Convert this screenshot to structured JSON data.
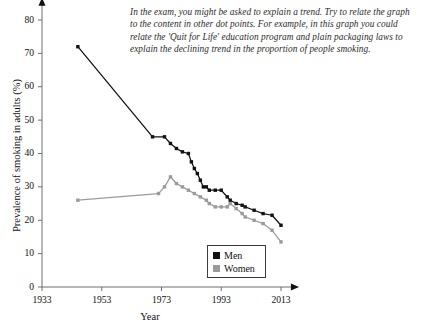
{
  "annotation": {
    "text": "In the exam, you might be asked to explain a trend. Try to relate the graph to the content in other dot points. For example, in this graph you could relate the 'Quit for Life' education program and plain packaging laws to explain the declining trend in the proportion of people smoking."
  },
  "legend": {
    "men_label": "Men",
    "women_label": "Women"
  },
  "colors": {
    "men": "#111111",
    "women": "#9a9a9a",
    "axis": "#6e6e6e",
    "legend_border": "#3c3c3c"
  },
  "chart_data": {
    "type": "line",
    "title": "",
    "subtitle": "",
    "xlabel": "Year",
    "ylabel": "Prevalence of smoking in adults (%)",
    "xlim": [
      1933,
      2016
    ],
    "ylim": [
      0,
      84
    ],
    "xticks": [
      1933,
      1953,
      1973,
      1993,
      2013
    ],
    "xtick_labels": [
      "1933",
      "1953",
      "1973",
      "1993",
      "2013"
    ],
    "yticks": [
      0,
      10,
      20,
      30,
      40,
      50,
      60,
      70,
      80
    ],
    "ytick_labels": [
      "0",
      "10",
      "20",
      "30",
      "40",
      "50",
      "60",
      "70",
      "80"
    ],
    "grid": false,
    "legend_position": "lower-center",
    "markers": "square",
    "series": [
      {
        "name": "Men",
        "color": "#111111",
        "x": [
          1945,
          1970,
          1974,
          1976,
          1978,
          1980,
          1982,
          1983,
          1984,
          1985,
          1986,
          1987,
          1988,
          1989,
          1991,
          1993,
          1995,
          1996,
          1998,
          2000,
          2001,
          2004,
          2007,
          2010,
          2013
        ],
        "y": [
          72,
          45,
          45,
          43,
          41.5,
          40.5,
          40,
          37.5,
          35.5,
          34,
          32,
          30,
          30,
          29,
          29,
          29,
          27,
          26,
          25,
          24.5,
          24,
          23,
          22,
          21.5,
          18.5
        ]
      },
      {
        "name": "Women",
        "color": "#9a9a9a",
        "x": [
          1945,
          1972,
          1974,
          1976,
          1978,
          1980,
          1982,
          1984,
          1986,
          1988,
          1989,
          1991,
          1993,
          1995,
          1996,
          1998,
          2000,
          2001,
          2004,
          2007,
          2010,
          2013
        ],
        "y": [
          26,
          28,
          30,
          33,
          31,
          30,
          29,
          28,
          27,
          26,
          25,
          24,
          24,
          24,
          25,
          23.5,
          22,
          21,
          20,
          19,
          17,
          13.5
        ]
      }
    ]
  }
}
